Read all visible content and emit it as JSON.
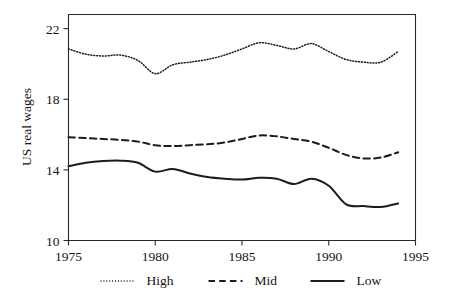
{
  "chart_data": {
    "type": "line",
    "title": "",
    "xlabel": "",
    "ylabel": "US real wages",
    "xlim": [
      1975,
      1995
    ],
    "ylim": [
      10,
      22.8
    ],
    "xticks": [
      1975,
      1980,
      1985,
      1990,
      1995
    ],
    "yticks": [
      10,
      14,
      18,
      22
    ],
    "xtick_labels": [
      "1975",
      "1980",
      "1985",
      "1990",
      "1995"
    ],
    "ytick_labels": [
      "10",
      "14",
      "18",
      "22"
    ],
    "grid": false,
    "legend_position": "below",
    "x": [
      1975,
      1976,
      1977,
      1978,
      1979,
      1980,
      1981,
      1982,
      1983,
      1984,
      1985,
      1986,
      1987,
      1988,
      1989,
      1990,
      1991,
      1992,
      1993,
      1994
    ],
    "series": [
      {
        "name": "High",
        "style": "dotted",
        "color": "#1c1c1c",
        "values": [
          20.85,
          20.55,
          20.45,
          20.5,
          20.2,
          19.45,
          19.95,
          20.1,
          20.25,
          20.5,
          20.85,
          21.2,
          21.05,
          20.85,
          21.15,
          20.7,
          20.25,
          20.1,
          20.1,
          20.7
        ]
      },
      {
        "name": "Mid",
        "style": "dashed",
        "color": "#1c1c1c",
        "values": [
          15.85,
          15.8,
          15.75,
          15.7,
          15.6,
          15.4,
          15.35,
          15.4,
          15.45,
          15.55,
          15.75,
          15.95,
          15.9,
          15.75,
          15.6,
          15.25,
          14.85,
          14.65,
          14.7,
          15.0
        ]
      },
      {
        "name": "Low",
        "style": "solid",
        "color": "#1c1c1c",
        "values": [
          14.2,
          14.4,
          14.5,
          14.52,
          14.4,
          13.9,
          14.05,
          13.8,
          13.6,
          13.5,
          13.45,
          13.55,
          13.5,
          13.2,
          13.5,
          13.1,
          12.05,
          11.95,
          11.9,
          12.1
        ]
      }
    ]
  },
  "legend": {
    "items": [
      {
        "label": "High",
        "style": "dotted"
      },
      {
        "label": "Mid",
        "style": "dashed"
      },
      {
        "label": "Low",
        "style": "solid"
      }
    ]
  },
  "axis": {
    "y_title": "US real wages"
  }
}
